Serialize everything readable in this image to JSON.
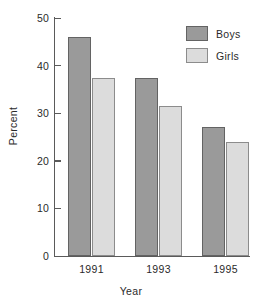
{
  "chart_data": {
    "type": "bar",
    "title": "",
    "subtitle": "",
    "xlabel": "Year",
    "ylabel": "Percent",
    "categories": [
      "1991",
      "1993",
      "1995"
    ],
    "series": [
      {
        "name": "Boys",
        "values": [
          46.0,
          37.3,
          27.0
        ],
        "color": "#9a9a9a"
      },
      {
        "name": "Girls",
        "values": [
          37.5,
          31.5,
          24.0
        ],
        "color": "#dcdcdc"
      }
    ],
    "ylim": [
      0,
      50
    ],
    "yticks": [
      0,
      10,
      20,
      30,
      40,
      50
    ],
    "ytick_labels": [
      "0",
      "10",
      "20",
      "30",
      "40",
      "50"
    ],
    "grid": false,
    "legend_position": "top-right",
    "legend_entries": [
      "Boys",
      "Girls"
    ],
    "annotations": []
  }
}
